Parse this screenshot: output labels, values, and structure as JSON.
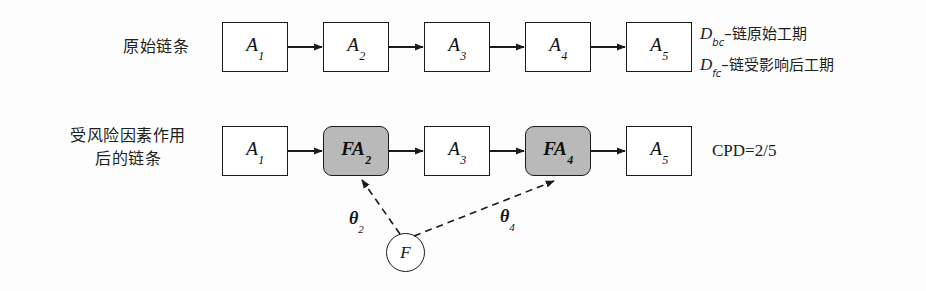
{
  "figure": {
    "background_color": "#fdfdfd",
    "line_color": "#1b1b1b",
    "risk_node_fill": "#b9b9b9"
  },
  "rows": [
    {
      "label": "原始链条",
      "nodes": [
        {
          "base": "A",
          "sub": "1",
          "risk": false
        },
        {
          "base": "A",
          "sub": "2",
          "risk": false
        },
        {
          "base": "A",
          "sub": "3",
          "risk": false
        },
        {
          "base": "A",
          "sub": "4",
          "risk": false
        },
        {
          "base": "A",
          "sub": "5",
          "risk": false
        }
      ]
    },
    {
      "label": "受风险因素作用\n后的链条",
      "nodes": [
        {
          "base": "A",
          "sub": "1",
          "risk": false
        },
        {
          "base": "FA",
          "sub": "2",
          "risk": true
        },
        {
          "base": "A",
          "sub": "3",
          "risk": false
        },
        {
          "base": "FA",
          "sub": "4",
          "risk": true
        },
        {
          "base": "A",
          "sub": "5",
          "risk": false
        }
      ]
    }
  ],
  "legend": [
    {
      "symbol": "D",
      "subscript": "bc",
      "text": "–链原始工期"
    },
    {
      "symbol": "D",
      "subscript": "fc",
      "text": "–链受影响后工期"
    }
  ],
  "cpd": {
    "label": "CPD=2/5"
  },
  "risk_source": {
    "label": "F"
  },
  "theta_labels": [
    {
      "symbol": "θ",
      "subscript": "2"
    },
    {
      "symbol": "θ",
      "subscript": "4"
    }
  ]
}
